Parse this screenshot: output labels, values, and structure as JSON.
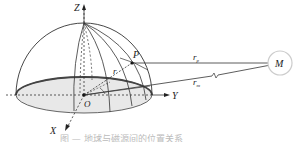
{
  "diagram": {
    "axes": {
      "z_label": "Z",
      "x_label": "X",
      "y_label": "Y",
      "origin_label": "O"
    },
    "points": {
      "p_label": "P",
      "m_label": "M"
    },
    "vectors": {
      "r_label": "r",
      "rp_label": "r",
      "rp_sub": "p",
      "rm_label": "r",
      "rm_sub": "m"
    },
    "angle_labels": {
      "phi": "φ",
      "theta": "θ"
    },
    "colors": {
      "line": "#333333",
      "ellipse_fill": "#e6e6e6",
      "ellipse_rim": "#555555",
      "m_circle": "#cccccc"
    }
  },
  "caption": {
    "text": "图 — 地球与磁源间的位置关系"
  }
}
